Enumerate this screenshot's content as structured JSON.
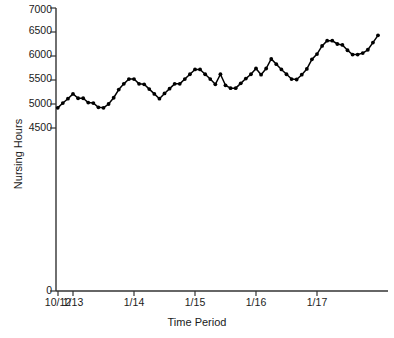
{
  "chart_data": {
    "type": "line",
    "title": "",
    "xlabel": "Time Period",
    "ylabel": "Nursing Hours",
    "ylim": [
      0,
      7000
    ],
    "y_axis_break": true,
    "y_break_between": [
      0,
      4500
    ],
    "grid": false,
    "legend": null,
    "marker": "filled-circle",
    "line_color": "#000000",
    "y_tick_labels": [
      "7000",
      "6500",
      "6000",
      "5500",
      "5000",
      "4500",
      "0"
    ],
    "y_ticks": [
      7000,
      6500,
      6000,
      5500,
      5000,
      4500,
      0
    ],
    "x_tick_labels": [
      "10/12",
      "1/13",
      "1/14",
      "1/15",
      "1/16",
      "1/17"
    ],
    "x_tick_index": [
      0,
      3,
      15,
      27,
      39,
      51
    ],
    "values": [
      4920,
      5020,
      5110,
      5210,
      5120,
      5120,
      5030,
      5020,
      4930,
      4920,
      5000,
      5130,
      5300,
      5420,
      5520,
      5520,
      5420,
      5410,
      5310,
      5210,
      5110,
      5220,
      5320,
      5420,
      5420,
      5520,
      5620,
      5720,
      5720,
      5620,
      5520,
      5410,
      5620,
      5390,
      5330,
      5330,
      5430,
      5530,
      5620,
      5740,
      5610,
      5740,
      5940,
      5830,
      5720,
      5620,
      5520,
      5510,
      5610,
      5730,
      5930,
      6040,
      6210,
      6320,
      6320,
      6250,
      6230,
      6120,
      6030,
      6030,
      6060,
      6130,
      6280,
      6430
    ],
    "x_index": [
      0,
      1,
      2,
      3,
      4,
      5,
      6,
      7,
      8,
      9,
      10,
      11,
      12,
      13,
      14,
      15,
      16,
      17,
      18,
      19,
      20,
      21,
      22,
      23,
      24,
      25,
      26,
      27,
      28,
      29,
      30,
      31,
      32,
      33,
      34,
      35,
      36,
      37,
      38,
      39,
      40,
      41,
      42,
      43,
      44,
      45,
      46,
      47,
      48,
      49,
      50,
      51,
      52,
      53,
      54,
      55,
      56,
      57,
      58,
      59,
      60,
      61,
      62,
      63
    ],
    "series": [
      {
        "name": "Nursing Hours",
        "values": [
          4920,
          5020,
          5110,
          5210,
          5120,
          5120,
          5030,
          5020,
          4930,
          4920,
          5000,
          5130,
          5300,
          5420,
          5520,
          5520,
          5420,
          5410,
          5310,
          5210,
          5110,
          5220,
          5320,
          5420,
          5420,
          5520,
          5620,
          5720,
          5720,
          5620,
          5520,
          5410,
          5620,
          5390,
          5330,
          5330,
          5430,
          5530,
          5620,
          5740,
          5610,
          5740,
          5940,
          5830,
          5720,
          5620,
          5520,
          5510,
          5610,
          5730,
          5930,
          6040,
          6210,
          6320,
          6320,
          6250,
          6230,
          6120,
          6030,
          6030,
          6060,
          6130,
          6280,
          6430
        ]
      }
    ]
  },
  "axes": {
    "y_title": "Nursing Hours",
    "x_title": "Time Period",
    "y_labels": {
      "t0": "7000",
      "t1": "6500",
      "t2": "6000",
      "t3": "5500",
      "t4": "5000",
      "t5": "4500",
      "t6": "0"
    },
    "x_labels": {
      "t0": "10/12",
      "t1": "1/13",
      "t2": "1/14",
      "t3": "1/15",
      "t4": "1/16",
      "t5": "1/17"
    }
  },
  "colors": {
    "axis": "#333333",
    "line": "#000000",
    "text": "#1a1a1a",
    "background": "#ffffff"
  }
}
